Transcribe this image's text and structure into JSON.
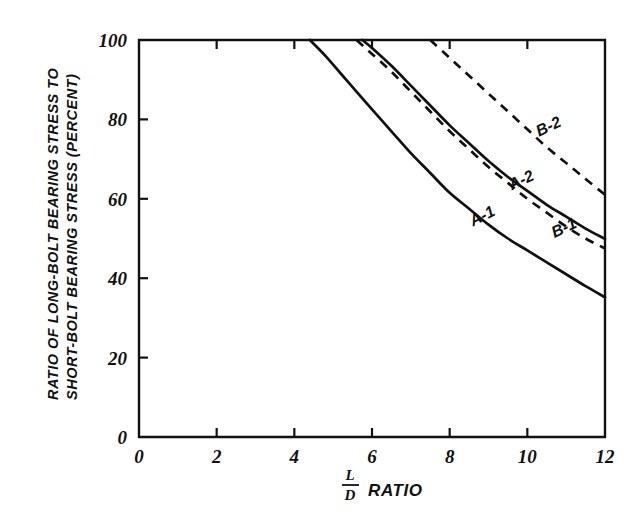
{
  "chart_data": {
    "type": "line",
    "title": "",
    "xlabel": "L/D RATIO",
    "xlabel_numerator": "L",
    "xlabel_denominator": "D",
    "xlabel_suffix": "RATIO",
    "ylabel": "RATIO OF LONG-BOLT BEARING STRESS TO SHORT-BOLT BEARING STRESS (PERCENT)",
    "ylabel_line1": "RATIO OF LONG-BOLT BEARING STRESS TO",
    "ylabel_line2": "SHORT-BOLT BEARING STRESS (PERCENT)",
    "xlim": [
      0,
      12
    ],
    "ylim": [
      0,
      100
    ],
    "xticks": [
      0,
      2,
      4,
      6,
      8,
      10,
      12
    ],
    "xticklabels": [
      "0",
      "2",
      "4",
      "6",
      "8",
      "10",
      "12"
    ],
    "yticks": [
      0,
      20,
      40,
      60,
      80,
      100
    ],
    "yticklabels": [
      "0",
      "20",
      "40",
      "60",
      "80",
      "100"
    ],
    "grid": false,
    "legend": "inline-curve-labels",
    "line_color": "#111111",
    "series": [
      {
        "name": "A-1",
        "label": "A-1",
        "style": "solid",
        "label_x": 8.9,
        "label_y": 54.5,
        "label_rotation": -27,
        "x": [
          4.4,
          4.8,
          5.2,
          5.6,
          6.0,
          6.5,
          7.0,
          7.5,
          8.0,
          8.5,
          9.0,
          9.5,
          10.0,
          10.5,
          11.0,
          11.5,
          12.0
        ],
        "y": [
          100,
          96.0,
          91.5,
          87.0,
          82.5,
          77.0,
          71.5,
          66.5,
          61.5,
          57.5,
          53.5,
          50.0,
          47.0,
          44.0,
          41.0,
          38.0,
          35.2
        ]
      },
      {
        "name": "A-2",
        "label": "A-2",
        "style": "solid",
        "label_x": 9.9,
        "label_y": 63.5,
        "label_rotation": -25,
        "x": [
          5.75,
          6.0,
          6.5,
          7.0,
          7.5,
          8.0,
          8.5,
          9.0,
          9.5,
          10.0,
          10.5,
          11.0,
          11.5,
          12.0
        ],
        "y": [
          100,
          98.0,
          93.5,
          88.5,
          83.5,
          78.5,
          74.0,
          69.5,
          65.5,
          62.0,
          58.5,
          55.5,
          52.5,
          49.9
        ]
      },
      {
        "name": "B-1",
        "label": "B-1",
        "style": "dashed",
        "label_x": 11.0,
        "label_y": 51.5,
        "label_rotation": -25,
        "x": [
          5.6,
          6.0,
          6.5,
          7.0,
          7.5,
          8.0,
          8.5,
          9.0,
          9.5,
          10.0,
          10.5,
          11.0,
          11.5,
          12.0
        ],
        "y": [
          100,
          96.5,
          92.0,
          87.0,
          82.0,
          77.0,
          72.5,
          68.0,
          64.0,
          60.0,
          56.5,
          53.0,
          50.0,
          47.5
        ]
      },
      {
        "name": "B-2",
        "label": "B-2",
        "style": "dashed",
        "label_x": 10.6,
        "label_y": 77.0,
        "label_rotation": -25,
        "x": [
          7.5,
          8.0,
          8.5,
          9.0,
          9.5,
          10.0,
          10.5,
          11.0,
          11.5,
          12.0
        ],
        "y": [
          100,
          95.5,
          91.0,
          86.5,
          82.0,
          77.5,
          73.0,
          69.0,
          65.0,
          61.0
        ]
      }
    ]
  }
}
